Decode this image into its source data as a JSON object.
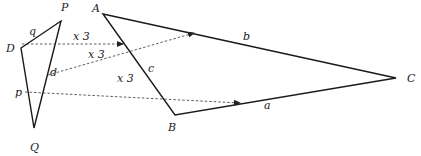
{
  "diagram": {
    "small_triangle": {
      "vertices": {
        "P": {
          "label": "P",
          "x": 61,
          "y": 21,
          "lx": 61,
          "ly": 11
        },
        "D": {
          "label": "D",
          "x": 21,
          "y": 48,
          "lx": 6,
          "ly": 52
        },
        "Q": {
          "label": "Q",
          "x": 34,
          "y": 128,
          "lx": 30,
          "ly": 151
        }
      },
      "side_labels": {
        "q": {
          "label": "q",
          "x": 29,
          "y": 35
        },
        "d": {
          "label": "d",
          "x": 50,
          "y": 76
        },
        "p": {
          "label": "p",
          "x": 15,
          "y": 96
        }
      }
    },
    "large_triangle": {
      "vertices": {
        "A": {
          "label": "A",
          "x": 103,
          "y": 14,
          "lx": 92,
          "ly": 12
        },
        "B": {
          "label": "B",
          "x": 175,
          "y": 115,
          "lx": 168,
          "ly": 131
        },
        "C": {
          "label": "C",
          "x": 396,
          "y": 78,
          "lx": 407,
          "ly": 82
        }
      },
      "side_labels": {
        "b": {
          "label": "b",
          "x": 243,
          "y": 40
        },
        "c": {
          "label": "c",
          "x": 148,
          "y": 72
        },
        "a": {
          "label": "a",
          "x": 264,
          "y": 109
        }
      }
    },
    "scale_arrows": [
      {
        "label": "x 3",
        "x1": 22,
        "y1": 44,
        "x2": 123,
        "y2": 44,
        "lx": 73,
        "ly": 40
      },
      {
        "label": "x 3",
        "x1": 48,
        "y1": 75,
        "x2": 194,
        "y2": 33,
        "lx": 88,
        "ly": 58
      },
      {
        "label": "x 3",
        "x1": 25,
        "y1": 92,
        "x2": 240,
        "y2": 103,
        "lx": 117,
        "ly": 82
      }
    ]
  }
}
